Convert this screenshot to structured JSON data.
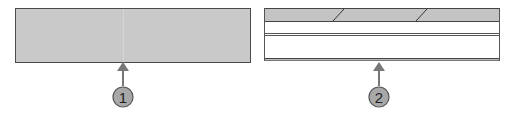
{
  "figure": {
    "callouts": [
      {
        "id": 1,
        "label": "1",
        "target": "solid-gray-panel"
      },
      {
        "id": 2,
        "label": "2",
        "target": "layered-panel"
      }
    ],
    "colors": {
      "panel_fill": "#c9c9c9",
      "panel_border": "#4a4a4a",
      "arrow": "#777777",
      "callout_fill": "#a8a8a8",
      "callout_stroke": "#555555"
    }
  }
}
